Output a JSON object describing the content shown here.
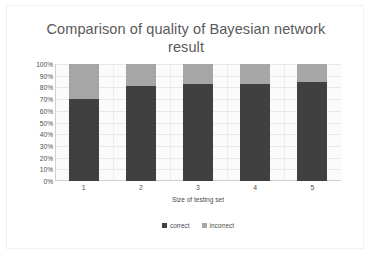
{
  "chart_data": {
    "type": "bar",
    "subtype": "stacked-100-percent",
    "title": "Comparison of quality of Bayesian network\nresult",
    "xlabel": "Size of testing set",
    "ylabel": "",
    "categories": [
      "1",
      "2",
      "3",
      "4",
      "5"
    ],
    "series": [
      {
        "name": "correct",
        "color": "#404040",
        "values": [
          70,
          81,
          83,
          83,
          85
        ]
      },
      {
        "name": "incorrect",
        "color": "#a6a6a6",
        "values": [
          30,
          19,
          17,
          17,
          15
        ]
      }
    ],
    "ylim": [
      0,
      100
    ],
    "ytick_labels": [
      "100%",
      "90%",
      "80%",
      "70%",
      "60%",
      "50%",
      "40%",
      "30%",
      "20%",
      "10%",
      "0%"
    ],
    "ytick_values": [
      100,
      90,
      80,
      70,
      60,
      50,
      40,
      30,
      20,
      10,
      0
    ],
    "grid": true,
    "legend_position": "bottom"
  },
  "colors": {
    "title_text": "#595959",
    "axis_text": "#4d4d4d",
    "correct": "#404040",
    "incorrect": "#a6a6a6",
    "gridline": "#e8e8e8",
    "plot_background": "#fbfbfb",
    "frame_border": "#f2f2f2"
  }
}
